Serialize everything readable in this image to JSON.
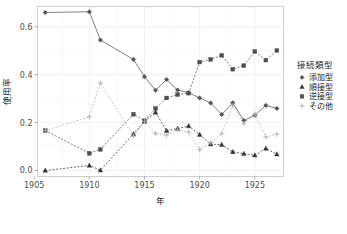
{
  "chart_data": {
    "type": "line",
    "title": "",
    "xlabel": "年",
    "ylabel": "使用率",
    "xlim": [
      1905.3,
      1927.6
    ],
    "ylim": [
      -0.025,
      0.685
    ],
    "xticks": [
      1905,
      1910,
      1915,
      1920,
      1925
    ],
    "xtick_labels": [
      "1905",
      "1910",
      "1915",
      "1920",
      "1925"
    ],
    "yticks": [
      0.0,
      0.2,
      0.4,
      0.6
    ],
    "ytick_labels": [
      "0.0",
      "0.2",
      "0.4",
      "0.6"
    ],
    "grid": true,
    "legend_position": "right",
    "legend_title": "接続類型",
    "series": [
      {
        "name": "添加型",
        "marker": "diamond",
        "linestyle": "solid",
        "color": "#555555",
        "x": [
          1906,
          1910,
          1911,
          1914,
          1915,
          1916,
          1917,
          1918,
          1919,
          1920,
          1921,
          1922,
          1923,
          1924,
          1925,
          1926,
          1927
        ],
        "y": [
          0.66,
          0.663,
          0.545,
          0.464,
          0.392,
          0.335,
          0.38,
          0.336,
          0.325,
          0.303,
          0.282,
          0.234,
          0.283,
          0.209,
          0.231,
          0.272,
          0.259
        ]
      },
      {
        "name": "順接型",
        "marker": "triangle",
        "linestyle": "dashed",
        "color": "#333333",
        "x": [
          1906,
          1910,
          1911,
          1914,
          1915,
          1916,
          1917,
          1918,
          1919,
          1920,
          1921,
          1922,
          1923,
          1924,
          1925,
          1926,
          1927
        ],
        "y": [
          0.0,
          0.021,
          0.001,
          0.152,
          0.205,
          0.243,
          0.166,
          0.175,
          0.186,
          0.15,
          0.11,
          0.108,
          0.078,
          0.07,
          0.064,
          0.092,
          0.068
        ]
      },
      {
        "name": "逆接型",
        "marker": "square",
        "linestyle": "dashed",
        "color": "#4d4d4d",
        "x": [
          1906,
          1910,
          1911,
          1914,
          1915,
          1916,
          1917,
          1918,
          1919,
          1920,
          1921,
          1922,
          1923,
          1924,
          1925,
          1926,
          1927
        ],
        "y": [
          0.167,
          0.072,
          0.088,
          0.235,
          0.208,
          0.259,
          0.303,
          0.317,
          0.323,
          0.453,
          0.464,
          0.481,
          0.423,
          0.438,
          0.497,
          0.461,
          0.501
        ]
      },
      {
        "name": "その他",
        "marker": "plus",
        "linestyle": "dashed",
        "color": "#b0b0b0",
        "x": [
          1906,
          1910,
          1911,
          1914,
          1915,
          1916,
          1917,
          1918,
          1919,
          1920,
          1921,
          1922,
          1923,
          1924,
          1925,
          1926,
          1927
        ],
        "y": [
          0.167,
          0.224,
          0.366,
          0.144,
          0.205,
          0.154,
          0.148,
          0.17,
          0.161,
          0.087,
          0.117,
          0.153,
          0.271,
          0.195,
          0.235,
          0.14,
          0.152
        ]
      }
    ]
  },
  "legend": {
    "title": "接続類型",
    "items": [
      {
        "label": "添加型",
        "marker": "diamond",
        "color": "#555555"
      },
      {
        "label": "順接型",
        "marker": "triangle",
        "color": "#333333"
      },
      {
        "label": "逆接型",
        "marker": "square",
        "color": "#4d4d4d"
      },
      {
        "label": "その他",
        "marker": "plus",
        "color": "#b0b0b0"
      }
    ]
  },
  "axes": {
    "x_title": "年",
    "y_title": "使用率"
  }
}
